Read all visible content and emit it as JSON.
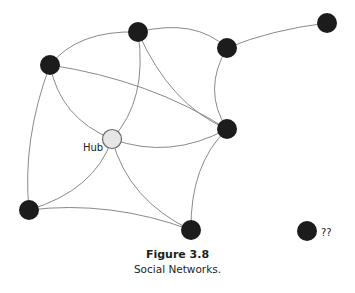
{
  "figure": {
    "title": "Figure 3.8",
    "caption": "Social Networks.",
    "colors": {
      "node": "#1c1c1c",
      "hub_fill": "#e6e6e6",
      "edge": "#8a8a8a"
    }
  },
  "graph": {
    "nodes": [
      {
        "id": "A",
        "x": 50,
        "y": 65,
        "r": 10,
        "type": "person"
      },
      {
        "id": "B",
        "x": 138,
        "y": 32,
        "r": 10,
        "type": "person"
      },
      {
        "id": "C",
        "x": 227,
        "y": 48,
        "r": 10,
        "type": "person"
      },
      {
        "id": "D",
        "x": 327,
        "y": 23,
        "r": 10,
        "type": "person"
      },
      {
        "id": "E",
        "x": 227,
        "y": 129,
        "r": 10,
        "type": "person"
      },
      {
        "id": "Hub",
        "x": 112,
        "y": 139,
        "r": 10,
        "type": "hub",
        "label": "Hub"
      },
      {
        "id": "F",
        "x": 29,
        "y": 210,
        "r": 10,
        "type": "person"
      },
      {
        "id": "G",
        "x": 191,
        "y": 230,
        "r": 10,
        "type": "person"
      },
      {
        "id": "H",
        "x": 307,
        "y": 231,
        "r": 10,
        "type": "isolated",
        "label": "??"
      }
    ],
    "edges": [
      [
        "A",
        "B"
      ],
      [
        "B",
        "C"
      ],
      [
        "C",
        "D"
      ],
      [
        "C",
        "E"
      ],
      [
        "A",
        "E"
      ],
      [
        "B",
        "E"
      ],
      [
        "A",
        "Hub"
      ],
      [
        "B",
        "Hub"
      ],
      [
        "Hub",
        "E"
      ],
      [
        "A",
        "F"
      ],
      [
        "F",
        "Hub"
      ],
      [
        "F",
        "G"
      ],
      [
        "Hub",
        "G"
      ],
      [
        "E",
        "G"
      ]
    ]
  },
  "labels": {
    "hub": "Hub",
    "isolated": "??"
  }
}
